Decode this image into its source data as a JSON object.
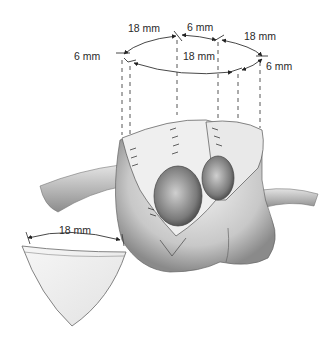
{
  "figure": {
    "type": "surgical-illustration",
    "ring_labels": {
      "top_left": "18 mm",
      "top_middle": "6 mm",
      "top_right": "18 mm",
      "left": "6 mm",
      "center": "18 mm",
      "right": "6 mm"
    },
    "patch_label": "18 mm"
  },
  "colors": {
    "background": "#ffffff",
    "line": "#333333",
    "tissue_light": "#e8e8e8",
    "tissue_mid": "#b8b8b8",
    "tissue_dark": "#6e6e6e"
  }
}
